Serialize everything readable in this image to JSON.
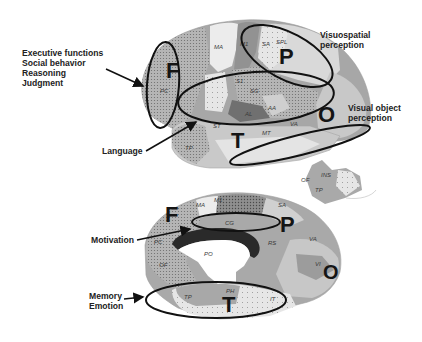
{
  "figure": {
    "type": "brain-function-map",
    "views": [
      "lateral",
      "medial"
    ]
  },
  "lateral_view": {
    "lobes": {
      "frontal": "F",
      "parietal": "P",
      "temporal": "T",
      "occipital": "O"
    },
    "areas": [
      "MA",
      "M1",
      "SA",
      "SPL",
      "PC",
      "S1",
      "SG",
      "AA",
      "AL",
      "ST",
      "VA",
      "MT",
      "TP",
      "VI"
    ],
    "callouts": [
      {
        "lines": [
          "Executive functions",
          "Social behavior",
          "Reasoning",
          "Judgment"
        ]
      },
      {
        "lines": [
          "Language"
        ]
      },
      {
        "lines": [
          "Visuospatial",
          "perception"
        ]
      },
      {
        "lines": [
          "Visual object",
          "perception"
        ]
      }
    ]
  },
  "insula_inset": {
    "areas": [
      "INS",
      "OF",
      "TP"
    ]
  },
  "medial_view": {
    "lobes": {
      "frontal": "F",
      "parietal": "P",
      "temporal": "T",
      "occipital": "O"
    },
    "areas": [
      "M1",
      "MA",
      "SA",
      "CG",
      "PC",
      "PO",
      "OF",
      "RS",
      "VA",
      "VI",
      "TP",
      "PH",
      "IT"
    ],
    "callouts": [
      {
        "lines": [
          "Motivation"
        ]
      },
      {
        "lines": [
          "Memory",
          "Emotion"
        ]
      }
    ]
  },
  "colors": {
    "background": "#ffffff",
    "outline": "#111111",
    "cortex_dark": "#8c8c8c",
    "cortex_mid": "#a8a8a8",
    "cortex_light": "#d4d4d4",
    "cortex_pale": "#e8e8e8",
    "corpus_callosum": "#2a2a2a"
  }
}
